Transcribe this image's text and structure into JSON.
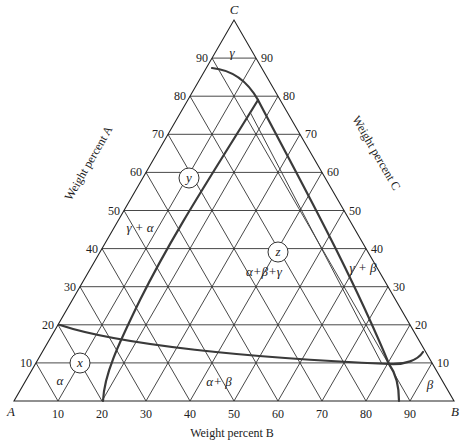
{
  "chart_data": {
    "type": "ternary-phase-diagram",
    "title": "",
    "vertices": {
      "A": "A",
      "B": "B",
      "C": "C"
    },
    "axis_labels": {
      "A": "Weight percent A",
      "B": "Weight percent B",
      "C": "Weight percent C"
    },
    "ticks": [
      10,
      20,
      30,
      40,
      50,
      60,
      70,
      80,
      90
    ],
    "grid_step": 10,
    "phase_regions": [
      "α",
      "β",
      "γ",
      "γ + α",
      "γ + β",
      "α + β",
      "α + β + γ"
    ],
    "labeled_points": [
      {
        "name": "x",
        "B": 10,
        "C": 10
      },
      {
        "name": "y",
        "B": 20,
        "C": 40
      },
      {
        "name": "z",
        "B": 50,
        "C": 40
      }
    ],
    "boundaries": [
      {
        "name": "gamma-boundary-arc",
        "desc": "from 90%C/10%B on AC side curving to apex near B≈20,C≈80"
      },
      {
        "name": "gamma-alpha-line",
        "desc": "from apex (B≈21,C≈79) down to baseline at B=20"
      },
      {
        "name": "gamma-beta-line",
        "desc": "from apex down to three-phase corner near B≈84,C≈10"
      },
      {
        "name": "alpha-beta-curve",
        "desc": "from 80%A on AB side across to ≈85%B,10%C"
      },
      {
        "name": "beta-boundary",
        "desc": "curve from ≈B 86,C 12 to baseline B≈88"
      }
    ]
  },
  "labels": {
    "vertex_a": "A",
    "vertex_b": "B",
    "vertex_c": "C",
    "axis_a": "Weight percent A",
    "axis_b": "Weight percent B",
    "axis_c": "Weight percent C",
    "alpha": "α",
    "beta": "β",
    "gamma": "γ",
    "gamma_alpha": "γ + α",
    "gamma_beta": "γ + β",
    "alpha_beta": "α+ β",
    "alpha_beta_gamma": "α+β+γ",
    "point_x": "x",
    "point_y": "y",
    "point_z": "z"
  },
  "left_ticks": [
    "10",
    "20",
    "30",
    "40",
    "50",
    "60",
    "70",
    "80",
    "90"
  ],
  "right_ticks": [
    "90",
    "80",
    "70",
    "60",
    "50",
    "40",
    "30",
    "20",
    "10"
  ],
  "bottom_ticks": [
    "10",
    "20",
    "30",
    "40",
    "50",
    "60",
    "70",
    "80",
    "90"
  ]
}
